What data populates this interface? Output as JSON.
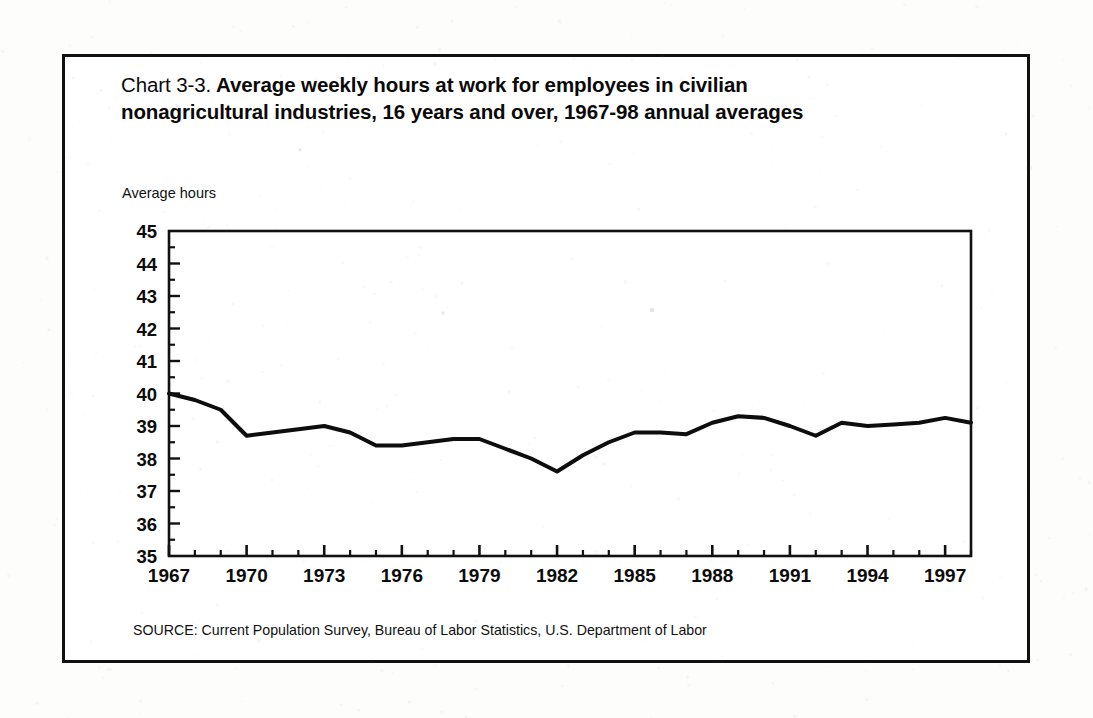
{
  "figure": {
    "chart_number": "Chart 3-3.",
    "title": "Average weekly hours at work for employees in civilian nonagricultural industries, 16 years and over, 1967-98 annual averages",
    "source": "SOURCE: Current Population Survey, Bureau of Labor Statistics, U.S. Department of Labor",
    "border_color": "#111111"
  },
  "chart_data": {
    "type": "line",
    "title": "Chart 3-3. Average weekly hours at work for employees in civilian nonagricultural industries, 16 years and over, 1967-98 annual averages",
    "subtitle": "",
    "xlabel": "",
    "ylabel": "Average hours",
    "ylim": [
      35,
      45
    ],
    "xlim": [
      1967,
      1998
    ],
    "ytick_labels": [
      "45",
      "44",
      "43",
      "42",
      "41",
      "40",
      "39",
      "38",
      "37",
      "36",
      "35"
    ],
    "yticks": [
      45,
      44,
      43,
      42,
      41,
      40,
      39,
      38,
      37,
      36,
      35
    ],
    "ytick_interval": 1,
    "xtick_labels": [
      "1967",
      "1970",
      "1973",
      "1976",
      "1979",
      "1982",
      "1985",
      "1988",
      "1991",
      "1994",
      "1997"
    ],
    "xticks": [
      1967,
      1970,
      1973,
      1976,
      1979,
      1982,
      1985,
      1988,
      1991,
      1994,
      1997
    ],
    "xtick_minor_interval": 1,
    "grid": false,
    "legend": null,
    "legend_position": "none",
    "line_color": "#0d0d0d",
    "line_width": 4,
    "annotations": [],
    "x": [
      1967,
      1968,
      1969,
      1970,
      1971,
      1972,
      1973,
      1974,
      1975,
      1976,
      1977,
      1978,
      1979,
      1980,
      1981,
      1982,
      1983,
      1984,
      1985,
      1986,
      1987,
      1988,
      1989,
      1990,
      1991,
      1992,
      1993,
      1994,
      1995,
      1996,
      1997,
      1998
    ],
    "series": [
      {
        "name": "Average weekly hours at work",
        "values": [
          40.0,
          39.8,
          39.5,
          38.7,
          38.8,
          38.9,
          39.0,
          38.8,
          38.4,
          38.4,
          38.5,
          38.6,
          38.6,
          38.3,
          38.0,
          37.6,
          38.1,
          38.5,
          38.8,
          38.8,
          38.75,
          39.1,
          39.3,
          39.25,
          39.0,
          38.7,
          39.1,
          39.0,
          39.05,
          39.1,
          39.25,
          39.1
        ]
      }
    ]
  }
}
